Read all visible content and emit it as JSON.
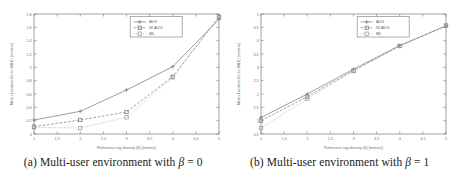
{
  "figure": {
    "panels": [
      {
        "id": "panel-a",
        "caption_prefix": "(a) Multi-user environment with ",
        "caption_symbol": "β",
        "caption_suffix": " = 0",
        "caption_full": "(a) Multi-user environment with β = 0"
      },
      {
        "id": "panel-b",
        "caption_prefix": "(b) Multi-user environment with ",
        "caption_symbol": "β",
        "caption_suffix": " = 1",
        "caption_full": "(b) Multi-user environment with β = 1"
      }
    ]
  },
  "chart_data": [
    {
      "type": "line",
      "panel": "a",
      "title": "",
      "xlabel": "Reference tag density (δ) [meters]",
      "ylabel": "Mean Location Error (MLE) [meters]",
      "x": [
        1,
        2,
        3,
        4,
        5
      ],
      "xlim": [
        1,
        5
      ],
      "ylim": [
        0,
        1.8
      ],
      "xticks": [
        1,
        1.5,
        2,
        2.5,
        3,
        3.5,
        4,
        4.5,
        5
      ],
      "xticklabels": [
        "1",
        "1.5",
        "2",
        "2.5",
        "3",
        "3.5",
        "4",
        "4.5",
        "5"
      ],
      "yticks": [
        0,
        0.2,
        0.4,
        0.6,
        0.8,
        1,
        1.2,
        1.4,
        1.6,
        1.8
      ],
      "yticklabels": [
        "0",
        "0.2",
        "0.4",
        "0.6",
        "0.8",
        "1",
        "1.2",
        "1.4",
        "1.6",
        "1.8"
      ],
      "grid": false,
      "legend_position": "upper center",
      "series": [
        {
          "name": "AVG",
          "marker": "plus",
          "linestyle": "solid",
          "color": "#8c8c8c",
          "values": [
            0.21,
            0.34,
            0.66,
            1.01,
            1.72
          ]
        },
        {
          "name": "W-AVG",
          "marker": "square",
          "linestyle": "dashed",
          "color": "#8f8f8f",
          "values": [
            0.11,
            0.21,
            0.33,
            0.86,
            1.76
          ]
        },
        {
          "name": "ML",
          "marker": "square",
          "linestyle": "dotted",
          "color": "#b9b9b9",
          "values": [
            0.1,
            0.09,
            0.25,
            0.85,
            1.75
          ]
        }
      ]
    },
    {
      "type": "line",
      "panel": "b",
      "title": "",
      "xlabel": "Reference tag density (δ) [meters]",
      "ylabel": "Mean Location Error (MLE) [meters]",
      "x": [
        1,
        2,
        3,
        4,
        5
      ],
      "xlim": [
        1,
        5
      ],
      "ylim": [
        0.5,
        5
      ],
      "xticks": [
        1,
        1.5,
        2,
        2.5,
        3,
        3.5,
        4,
        4.5,
        5
      ],
      "xticklabels": [
        "1",
        "1.5",
        "2",
        "2.5",
        "3",
        "3.5",
        "4",
        "4.5",
        "5"
      ],
      "yticks": [
        0.5,
        1,
        1.5,
        2,
        2.5,
        3,
        3.5,
        4,
        4.5,
        5
      ],
      "yticklabels": [
        "0.5",
        "1",
        "1.5",
        "2",
        "2.5",
        "3",
        "3.5",
        "4",
        "4.5",
        "5"
      ],
      "grid": false,
      "legend_position": "upper center",
      "series": [
        {
          "name": "AVG",
          "marker": "plus",
          "linestyle": "solid",
          "color": "#8c8c8c",
          "values": [
            1.12,
            2.0,
            2.93,
            3.82,
            4.55
          ]
        },
        {
          "name": "W-AVG",
          "marker": "square",
          "linestyle": "dashed",
          "color": "#8f8f8f",
          "values": [
            1.0,
            1.9,
            2.88,
            3.8,
            4.56
          ]
        },
        {
          "name": "ML",
          "marker": "square",
          "linestyle": "dotted",
          "color": "#b9b9b9",
          "values": [
            0.72,
            1.82,
            2.86,
            3.8,
            4.57
          ]
        }
      ]
    }
  ]
}
